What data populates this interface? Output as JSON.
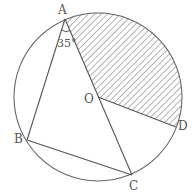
{
  "diagram": {
    "type": "circle-geometry",
    "circle": {
      "center_label": "O",
      "cx": 98,
      "cy": 97,
      "r": 84
    },
    "points": {
      "A": {
        "label": "A",
        "x": 65,
        "y": 19
      },
      "B": {
        "label": "B",
        "x": 27,
        "y": 140
      },
      "C": {
        "label": "C",
        "x": 132,
        "y": 175
      },
      "D": {
        "label": "D",
        "x": 176,
        "y": 127
      },
      "O": {
        "label": "O",
        "x": 98,
        "y": 97
      }
    },
    "segments": [
      "AB",
      "BC",
      "AC",
      "OD"
    ],
    "angle_label": "35°",
    "angle_at": "A",
    "shaded_region": "sector AOD (arc from A to D through top-right)",
    "colors": {
      "line": "#666666",
      "hatch": "#777777",
      "text": "#555555"
    }
  }
}
